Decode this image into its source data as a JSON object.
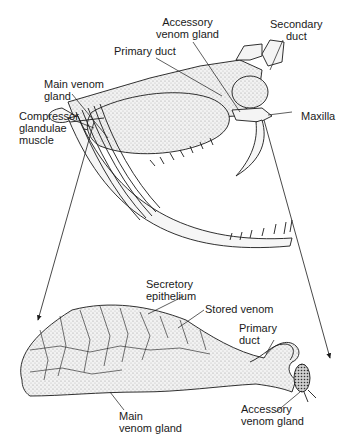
{
  "diagram": {
    "skull_labels": {
      "accessory_venom_gland": "Accessory\nvenom gland",
      "secondary_duct": "Secondary\nduct",
      "primary_duct": "Primary duct",
      "main_venom_gland": "Main venom\ngland",
      "compressor_muscle": "Compressor\nglandulae\nmuscle",
      "maxilla": "Maxilla"
    },
    "gland_labels": {
      "secretory_epithelium": "Secretory\nepithelium",
      "stored_venom": "Stored venom",
      "primary_duct": "Primary\nduct",
      "main_venom_gland": "Main\nvenom gland",
      "accessory_venom_gland": "Accessory\nvenom gland"
    },
    "colors": {
      "ink": "#1a1a1a",
      "stipple": "#bdbdbd",
      "background": "#ffffff"
    }
  }
}
